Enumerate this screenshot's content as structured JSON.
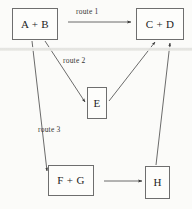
{
  "diagram": {
    "type": "reaction-route-flow-diagram",
    "background_color": "#fbfbf9",
    "stroke_color": "#6e6e6e",
    "text_color": "#1d1d1d",
    "nodes": [
      {
        "id": "ab",
        "label": "A + B"
      },
      {
        "id": "cd",
        "label": "C + D"
      },
      {
        "id": "e",
        "label": "E"
      },
      {
        "id": "fg",
        "label": "F + G"
      },
      {
        "id": "h",
        "label": "H"
      }
    ],
    "edges": [
      {
        "id": "edge-ab-cd",
        "from": "ab",
        "to": "cd",
        "label": "route 1"
      },
      {
        "id": "edge-ab-e",
        "from": "ab",
        "to": "e",
        "label": "route 2"
      },
      {
        "id": "edge-ab-fg",
        "from": "ab",
        "to": "fg",
        "label": "route 3"
      },
      {
        "id": "edge-e-cd",
        "from": "e",
        "to": "cd",
        "label": ""
      },
      {
        "id": "edge-fg-h",
        "from": "fg",
        "to": "h",
        "label": ""
      },
      {
        "id": "edge-h-cd",
        "from": "h",
        "to": "cd",
        "label": ""
      }
    ],
    "labels": {
      "route_1": "route 1",
      "route_2": "route 2",
      "route_3": "route 3"
    }
  }
}
